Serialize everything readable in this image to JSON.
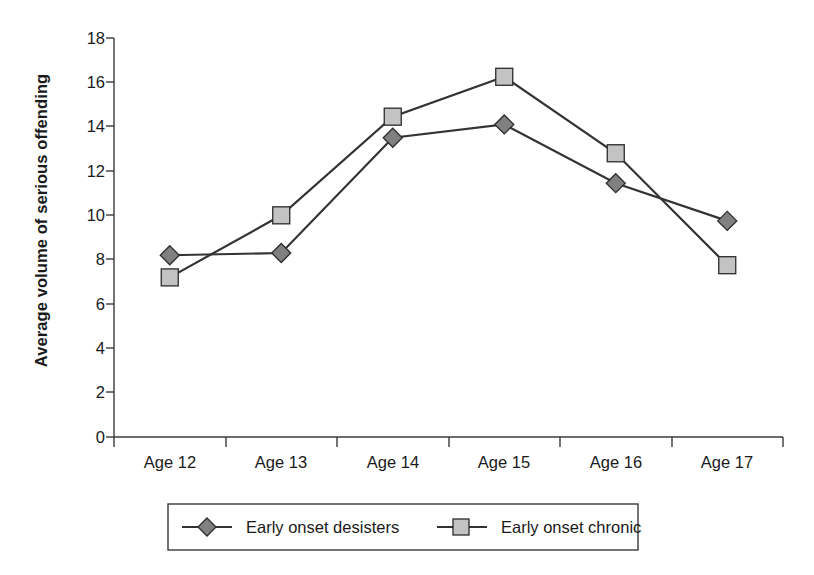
{
  "chart_data": {
    "type": "line",
    "title": "",
    "xlabel": "",
    "ylabel": "Average volume of serious offending",
    "categories": [
      "Age 12",
      "Age 13",
      "Age 14",
      "Age 15",
      "Age 16",
      "Age 17"
    ],
    "ylim": [
      0,
      18
    ],
    "ytick_step": 2,
    "yticks": [
      "0",
      "2",
      "4",
      "6",
      "8",
      "10",
      "12",
      "14",
      "16",
      "18"
    ],
    "grid": false,
    "legend_position": "bottom",
    "series": [
      {
        "name": "Early onset desisters",
        "marker": "diamond",
        "marker_fill": "#808080",
        "line_color": "#333333",
        "values": [
          8.2,
          8.3,
          13.5,
          14.1,
          11.45,
          9.75
        ]
      },
      {
        "name": "Early onset chronic",
        "marker": "square",
        "marker_fill": "#c3c3c3",
        "line_color": "#333333",
        "values": [
          7.2,
          10.0,
          14.45,
          16.25,
          12.8,
          7.75
        ]
      }
    ]
  },
  "legend": {
    "items": [
      {
        "label": "Early onset desisters",
        "marker": "diamond"
      },
      {
        "label": "Early onset chronic",
        "marker": "square"
      }
    ]
  },
  "axes": {
    "y_title": "Average volume of serious offending",
    "y_ticks": [
      "18",
      "16",
      "14",
      "12",
      "10",
      "8",
      "6",
      "4",
      "2",
      "0"
    ],
    "x_ticks": [
      "Age 12",
      "Age 13",
      "Age 14",
      "Age 15",
      "Age 16",
      "Age 17"
    ]
  }
}
